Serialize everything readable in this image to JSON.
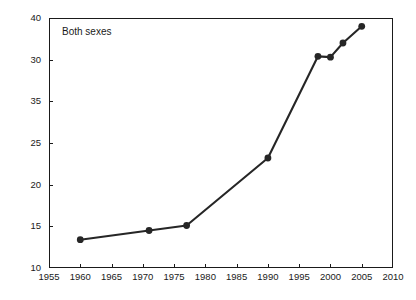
{
  "chart_data": {
    "type": "line",
    "title": "",
    "subtitle": "",
    "panel_label": "Both sexes",
    "xlabel": "",
    "ylabel": "% with BMI ≥30",
    "xlim": [
      1955,
      2010
    ],
    "ylim": [
      10,
      40
    ],
    "grid": false,
    "legend": null,
    "x_ticks": [
      1955,
      1960,
      1965,
      1970,
      1975,
      1980,
      1985,
      1990,
      1995,
      2000,
      2005,
      2010
    ],
    "x_tick_labels": [
      "1955",
      "1960",
      "1965",
      "1970",
      "1975",
      "1980",
      "1985",
      "1990",
      "1995",
      "2000",
      "2005",
      "2010"
    ],
    "y_ticks": [
      10,
      15,
      20,
      25,
      30,
      35,
      40
    ],
    "y_tick_labels_top_to_bottom": [
      "40",
      "30",
      "35",
      "25",
      "20",
      "15",
      "10"
    ],
    "y_tick_label_note": "As printed, the second and third labels from the top are transposed (30 appears above 35).",
    "series": [
      {
        "name": "Both sexes",
        "color": "#262626",
        "marker": "filled-circle",
        "x": [
          1960,
          1971,
          1977,
          1990,
          1998,
          2000,
          2002,
          2005
        ],
        "y": [
          13.4,
          14.5,
          15.1,
          23.2,
          35.4,
          35.3,
          37.0,
          39.0
        ]
      }
    ],
    "colors": {
      "line": "#262626",
      "marker": "#262626",
      "axis": "#1a1a1a",
      "background": "#ffffff"
    }
  }
}
